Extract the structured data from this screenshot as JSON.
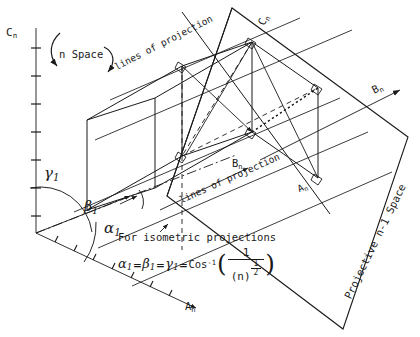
{
  "diagram": {
    "ink_color": "#1a1a1a",
    "background": "#ffffff"
  },
  "axes": {
    "c_axis_label": "C",
    "c_axis_sub": "n",
    "a_axis_label": "A",
    "a_axis_sub": "n",
    "b_axis_label": "B",
    "b_axis_sub": "n",
    "c_axis_upper_label": "C",
    "c_axis_upper_sub": "n",
    "b_inner_label": "B",
    "b_inner_sub": "n",
    "a_inner_label": "A",
    "a_inner_sub": "n"
  },
  "annotations": {
    "n_space": "n Space",
    "lines_of_projection_upper": "lines of projection",
    "lines_of_projection_lower": "lines of projection",
    "projective_space": "Projective n-1 Space"
  },
  "angles": {
    "gamma": "γ",
    "gamma_sub": "1",
    "beta": "β",
    "beta_sub": "1",
    "alpha": "α",
    "alpha_sub": "1"
  },
  "formula": {
    "caption": "For isometric projections",
    "alpha": "α",
    "alpha_sub": "1",
    "eq1": "=",
    "beta": "β",
    "beta_sub": "1",
    "eq2": "=",
    "gamma": "γ",
    "gamma_sub": "1",
    "eq3": "=",
    "cos": "Cos",
    "cos_exp": "-1",
    "open_paren": "(",
    "close_paren": ")",
    "numerator": "1",
    "den_base": "(n)",
    "den_exp_num": "1",
    "den_exp_den": "2"
  }
}
